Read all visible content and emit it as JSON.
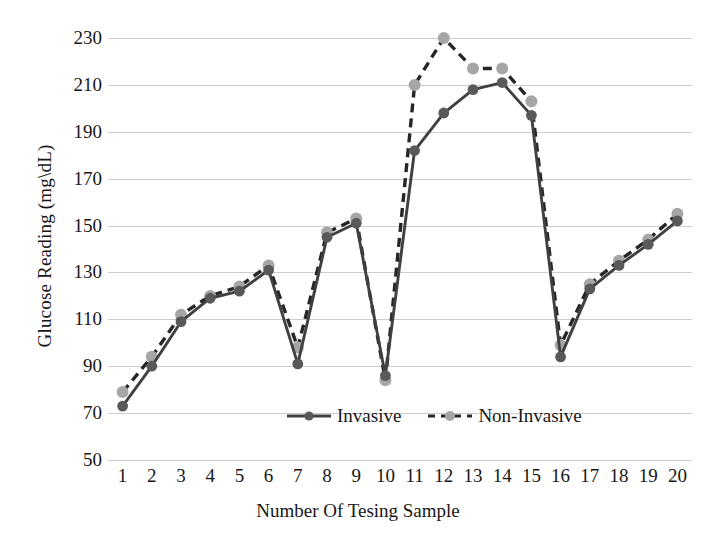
{
  "chart_data": {
    "type": "line",
    "title": "",
    "xlabel": "Number Of Tesing Sample",
    "ylabel": "Glucose Reading (mg\\dL)",
    "x": [
      1,
      2,
      3,
      4,
      5,
      6,
      7,
      8,
      9,
      10,
      11,
      12,
      13,
      14,
      15,
      16,
      17,
      18,
      19,
      20
    ],
    "categories": [
      "1",
      "2",
      "3",
      "4",
      "5",
      "6",
      "7",
      "8",
      "9",
      "10",
      "11",
      "12",
      "13",
      "14",
      "15",
      "16",
      "17",
      "18",
      "19",
      "20"
    ],
    "series": [
      {
        "name": "Invasive",
        "style": "solid",
        "color": "#404040",
        "marker_color": "#595959",
        "values": [
          73,
          90,
          109,
          119,
          122,
          131,
          91,
          145,
          151,
          86,
          182,
          198,
          208,
          211,
          197,
          94,
          123,
          133,
          142,
          152
        ]
      },
      {
        "name": "Non-Invasive",
        "style": "dashed",
        "color": "#262626",
        "marker_color": "#a6a6a6",
        "values": [
          79,
          94,
          112,
          120,
          124,
          133,
          98,
          147,
          153,
          84,
          210,
          230,
          217,
          217,
          203,
          99,
          125,
          135,
          144,
          155
        ]
      }
    ],
    "ylim": [
      50,
      230
    ],
    "yticks": [
      230,
      210,
      190,
      170,
      150,
      130,
      110,
      90,
      70,
      50
    ],
    "ytick_labels": [
      "230",
      "210",
      "190",
      "170",
      "150",
      "130",
      "110",
      "90",
      "70",
      "50"
    ],
    "grid": true,
    "gridline_color": "#c9c9cf",
    "legend_position": "bottom-center",
    "legend": [
      "Invasive",
      "Non-Invasive"
    ],
    "background": "#ffffff"
  }
}
